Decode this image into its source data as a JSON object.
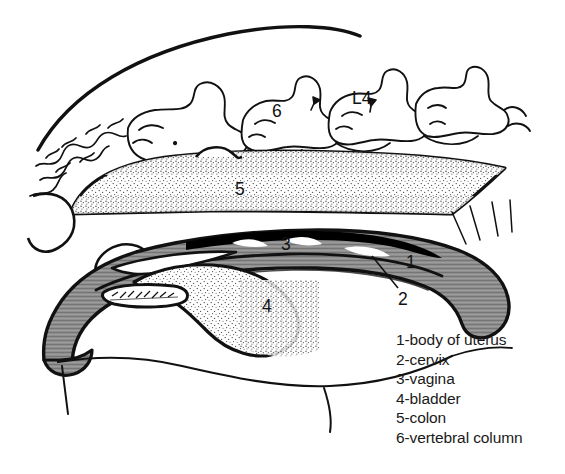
{
  "figure": {
    "background_color": "#ffffff",
    "ink_color": "#111111",
    "gray_fill": "#8c8c8c",
    "stipple_fill": "#fafafa",
    "cavity_color": "#000000"
  },
  "callouts": {
    "uterus_body": "1",
    "cervix": "2",
    "vagina": "3",
    "bladder": "4",
    "colon": "5",
    "vertebra_six": "6",
    "vertebra_l4": "L4"
  },
  "legend": {
    "items": [
      {
        "num": "1",
        "text": "1-body of uterus"
      },
      {
        "num": "2",
        "text": "2-cervix"
      },
      {
        "num": "3",
        "text": "3-vagina"
      },
      {
        "num": "4",
        "text": "4-bladder"
      },
      {
        "num": "5",
        "text": "5-colon"
      },
      {
        "num": "6",
        "text": "6-vertebral column"
      }
    ]
  }
}
